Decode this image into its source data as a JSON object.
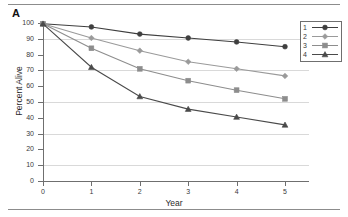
{
  "panel": {
    "label": "A"
  },
  "chart_data": {
    "type": "line",
    "title": "",
    "xlabel": "Year",
    "ylabel": "Percent Alive",
    "x": [
      0,
      1,
      2,
      3,
      4,
      5
    ],
    "xlim": [
      0,
      5.5
    ],
    "ylim": [
      0,
      100
    ],
    "xticks": [
      "0",
      "1",
      "2",
      "3",
      "4",
      "5"
    ],
    "yticks": [
      "0",
      "10",
      "20",
      "30",
      "40",
      "50",
      "60",
      "70",
      "80",
      "90",
      "100"
    ],
    "grid": "horizontal gridlines at 10, 30, 50, 70, 90",
    "gridvalues": [
      10,
      30,
      50,
      70,
      90
    ],
    "legend_position": "top-right inside plot",
    "series": [
      {
        "name": "1",
        "marker": "circle",
        "color": "#3f3f3f",
        "values": [
          99.5,
          97.5,
          93.0,
          90.5,
          88.0,
          85.0
        ]
      },
      {
        "name": "2",
        "marker": "diamond",
        "color": "#9a9a9a",
        "values": [
          99.5,
          90.5,
          82.5,
          75.5,
          71.0,
          66.5
        ]
      },
      {
        "name": "3",
        "marker": "square",
        "color": "#8d8d8d",
        "values": [
          99.5,
          84.0,
          71.0,
          63.5,
          57.5,
          52.0
        ]
      },
      {
        "name": "4",
        "marker": "triangle",
        "color": "#4a4a4a",
        "values": [
          99.5,
          72.0,
          53.5,
          45.5,
          40.5,
          35.5
        ]
      }
    ]
  },
  "legend": {
    "entries": [
      {
        "label": "1"
      },
      {
        "label": "2"
      },
      {
        "label": "3"
      },
      {
        "label": "4"
      }
    ]
  }
}
